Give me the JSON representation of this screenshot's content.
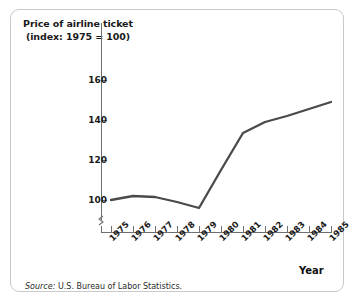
{
  "figure": {
    "source_note_label": "Source:",
    "source_note_text": " U.S. Bureau of Labor Statistics."
  },
  "chart_data": {
    "type": "line",
    "title": "",
    "ylabel": "Price of airline ticket (index: 1975 = 100)",
    "xlabel": "Year",
    "categories": [
      "1975",
      "1976",
      "1977",
      "1978",
      "1979",
      "1980",
      "1981",
      "1982",
      "1983",
      "1984",
      "1985"
    ],
    "values": [
      100,
      102,
      101.5,
      99,
      96,
      115,
      133.5,
      139,
      142,
      145.5,
      149
    ],
    "series": [
      {
        "name": "Price of airline ticket (index: 1975 = 100)",
        "values": [
          100,
          102,
          101.5,
          99,
          96,
          115,
          133.5,
          139,
          142,
          145.5,
          149
        ]
      }
    ],
    "y_ticks": [
      "100",
      "120",
      "140",
      "160"
    ],
    "y_tick_values": [
      100,
      120,
      140,
      160
    ],
    "ylim": [
      94,
      163
    ],
    "xlim": [
      "1975",
      "1985"
    ],
    "grid": false,
    "legend": "none",
    "axis_break": true,
    "line_color": "#4a4a4a",
    "axis_color": "#6f6f6f",
    "text_color": "#1a1a1a"
  }
}
